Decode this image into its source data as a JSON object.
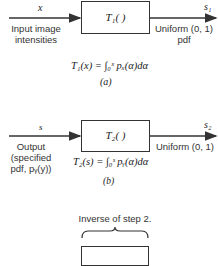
{
  "diagram_a": {
    "input_var": "x",
    "input_label_line1": "Input image",
    "input_label_line2": "intensities",
    "block_label": "T₁( )",
    "output_var": "s₁",
    "output_label_line1": "Uniform (0, 1)",
    "output_label_line2": "pdf",
    "equation": "T₁(x) = ∫₀ˣ pₓ(α)dα",
    "caption": "(a)"
  },
  "diagram_b": {
    "input_var": "s",
    "input_label_line1": "Output",
    "input_label_line2": "(specified",
    "input_label_line3": "pdf, pᵧ(y))",
    "block_label": "T₂( )",
    "output_var": "s₂",
    "output_label_line1": "Uniform (0, 1)",
    "equation": "T₂(s) = ∫₀ˢ pᵧ(α)dα",
    "caption": "(b)"
  },
  "diagram_c": {
    "brace_label": "Inverse of step 2."
  },
  "colors": {
    "line": "#333333",
    "background": "#ffffff"
  }
}
